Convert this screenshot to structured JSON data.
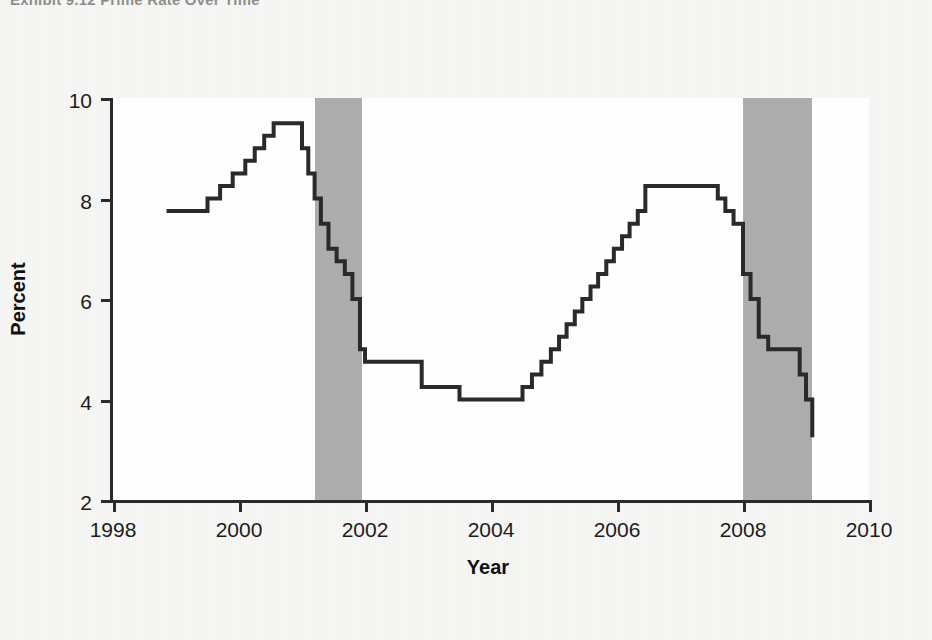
{
  "exhibit": {
    "title": "Exhibit 9.12  Prime Rate Over Time"
  },
  "colors": {
    "line": "#2a2a2a",
    "axis": "#2a2a2a",
    "recession_band": "#adadad",
    "plot_background": "#ffffff",
    "page_background": "#f6f6f4"
  },
  "chart_data": {
    "type": "line",
    "title": "Exhibit 9.12  Prime Rate Over Time",
    "xlabel": "Year",
    "ylabel": "Percent",
    "xlim": [
      1998,
      2010
    ],
    "ylim": [
      2,
      10
    ],
    "xticks": [
      1998,
      2000,
      2002,
      2004,
      2006,
      2008,
      2010
    ],
    "xtick_labels": [
      "1998",
      "2000",
      "2002",
      "2004",
      "2006",
      "2008",
      "2010"
    ],
    "yticks": [
      2,
      4,
      6,
      8,
      10
    ],
    "ytick_labels": [
      "2",
      "4",
      "6",
      "8",
      "10"
    ],
    "grid": false,
    "legend": false,
    "step_style": "post",
    "series": [
      {
        "name": "Prime Rate",
        "x": [
          1998.85,
          1999.5,
          1999.7,
          1999.9,
          2000.1,
          2000.25,
          2000.4,
          2000.55,
          2001.0,
          2001.1,
          2001.2,
          2001.3,
          2001.42,
          2001.55,
          2001.68,
          2001.8,
          2001.92,
          2002.0,
          2002.9,
          2003.5,
          2004.5,
          2004.65,
          2004.8,
          2004.95,
          2005.08,
          2005.2,
          2005.33,
          2005.45,
          2005.58,
          2005.7,
          2005.83,
          2005.95,
          2006.08,
          2006.2,
          2006.33,
          2006.45,
          2007.6,
          2007.72,
          2007.85,
          2008.0,
          2008.12,
          2008.25,
          2008.4,
          2008.55,
          2008.9,
          2009.0,
          2009.1
        ],
        "y": [
          7.75,
          8.0,
          8.25,
          8.5,
          8.75,
          9.0,
          9.25,
          9.5,
          9.0,
          8.5,
          8.0,
          7.5,
          7.0,
          6.75,
          6.5,
          6.0,
          5.0,
          4.75,
          4.25,
          4.0,
          4.25,
          4.5,
          4.75,
          5.0,
          5.25,
          5.5,
          5.75,
          6.0,
          6.25,
          6.5,
          6.75,
          7.0,
          7.25,
          7.5,
          7.75,
          8.25,
          8.0,
          7.75,
          7.5,
          6.5,
          6.0,
          5.25,
          5.0,
          5.0,
          4.5,
          4.0,
          3.25
        ]
      }
    ],
    "shaded_regions": [
      {
        "label": "recession-2001",
        "x_start": 2001.2,
        "x_end": 2001.95
      },
      {
        "label": "recession-2008",
        "x_start": 2008.0,
        "x_end": 2009.1
      }
    ],
    "annotations": []
  }
}
